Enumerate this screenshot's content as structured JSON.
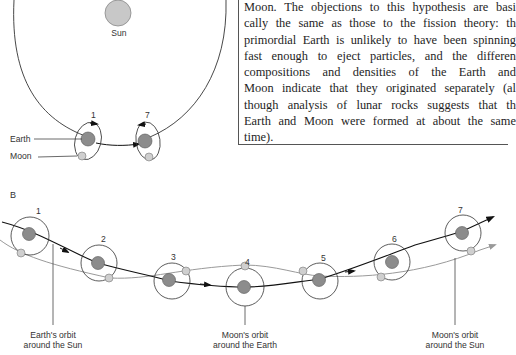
{
  "panel_a": {
    "sun_label": "Sun",
    "earth_label": "Earth",
    "moon_label": "Moon",
    "positions": [
      "1",
      "7"
    ]
  },
  "text_box": {
    "lines": [
      "Moon. The objections to this hypothesis are basi",
      "cally the same as those to the fission theory: th",
      "primordial Earth is unlikely to have been spinning",
      "fast enough to eject particles, and the differen",
      "compositions and densities of the Earth and",
      "Moon indicate that they originated separately (al",
      "though analysis of lunar rocks suggests that th",
      "Earth and Moon were formed at about the same",
      "time)."
    ]
  },
  "panel_b": {
    "panel_label": "B",
    "positions": [
      "1",
      "2",
      "3",
      "4",
      "5",
      "6",
      "7"
    ],
    "callouts": {
      "earth_orbit_sun": [
        "Earth's orbit",
        "around the Sun"
      ],
      "moon_orbit_earth": [
        "Moon's orbit",
        "around the Earth"
      ],
      "moon_orbit_sun": [
        "Moon's orbit",
        "around the Sun"
      ]
    }
  },
  "colors": {
    "earth": "#8c8c8c",
    "moon": "#cfcfcf",
    "sun": "#c8c8c8",
    "line": "#333333",
    "moon_path": "#8a8a8a"
  }
}
